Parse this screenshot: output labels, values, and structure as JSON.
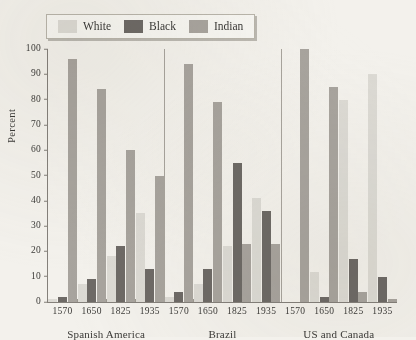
{
  "figure": {
    "ghost_title": "",
    "ylabel": "Percent"
  },
  "legend": {
    "items": [
      {
        "label": "White",
        "color": "#dcdad4"
      },
      {
        "label": "Black",
        "color": "#6e6a66"
      },
      {
        "label": "Indian",
        "color": "#a8a49e"
      }
    ]
  },
  "axis": {
    "yticks": [
      "0",
      "10",
      "20",
      "30",
      "40",
      "50",
      "60",
      "70",
      "80",
      "90",
      "100"
    ]
  },
  "chart_data": {
    "type": "bar",
    "title": "",
    "xlabel": "",
    "ylabel": "Percent",
    "ylim": [
      0,
      100
    ],
    "grid": false,
    "legend_position": "top-left",
    "categories": [
      "Spanish America 1570",
      "Spanish America 1650",
      "Spanish America 1825",
      "Spanish America 1935",
      "Brazil 1570",
      "Brazil 1650",
      "Brazil 1825",
      "Brazil 1935",
      "US and Canada 1570",
      "US and Canada 1650",
      "US and Canada 1825",
      "US and Canada 1935"
    ],
    "groups": [
      {
        "name": "Spanish America",
        "years": [
          "1570",
          "1650",
          "1825",
          "1935"
        ],
        "White": [
          1,
          7,
          18,
          35
        ],
        "Black": [
          2,
          9,
          22,
          13
        ],
        "Indian": [
          96,
          84,
          60,
          50
        ]
      },
      {
        "name": "Brazil",
        "years": [
          "1570",
          "1650",
          "1825",
          "1935"
        ],
        "White": [
          2,
          7,
          22,
          41
        ],
        "Black": [
          4,
          13,
          55,
          36
        ],
        "Indian": [
          94,
          79,
          23,
          23
        ]
      },
      {
        "name": "US and Canada",
        "years": [
          "1570",
          "1650",
          "1825",
          "1935"
        ],
        "White": [
          0,
          12,
          80,
          90
        ],
        "Black": [
          0,
          2,
          17,
          10
        ],
        "Indian": [
          100,
          85,
          4,
          1
        ]
      }
    ],
    "series": [
      {
        "name": "White",
        "color": "#dcdad4",
        "values": [
          1,
          7,
          18,
          35,
          2,
          7,
          22,
          41,
          0,
          12,
          80,
          90
        ]
      },
      {
        "name": "Black",
        "color": "#6e6a66",
        "values": [
          2,
          9,
          22,
          13,
          4,
          13,
          55,
          36,
          0,
          2,
          17,
          10
        ]
      },
      {
        "name": "Indian",
        "color": "#a8a49e",
        "values": [
          96,
          84,
          60,
          50,
          94,
          79,
          23,
          23,
          100,
          85,
          4,
          1
        ]
      }
    ]
  }
}
